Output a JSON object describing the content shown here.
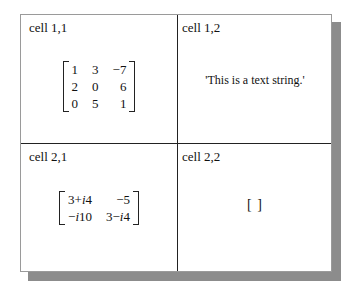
{
  "cells": {
    "c11": {
      "label": "cell 1,1",
      "type": "numeric matrix",
      "matrix": [
        [
          "1",
          "3",
          "−7"
        ],
        [
          "2",
          "0",
          "6"
        ],
        [
          "0",
          "5",
          "1"
        ]
      ]
    },
    "c12": {
      "label": "cell 1,2",
      "type": "text",
      "value": "'This is a text string.'"
    },
    "c21": {
      "label": "cell 2,1",
      "type": "complex matrix",
      "matrix": [
        [
          "3 + i4",
          "−5"
        ],
        [
          "−i10",
          "3 − i4"
        ]
      ],
      "display": [
        [
          "3+",
          "i",
          "4",
          "−5"
        ],
        [
          "−",
          "i",
          "10",
          "3−",
          "i",
          "4"
        ]
      ]
    },
    "c22": {
      "label": "cell 2,2",
      "type": "empty",
      "value": "[ ]"
    }
  },
  "colors": {
    "shadow": "#8c8c8c",
    "divider": "#222222",
    "border": "#9a9a9a"
  }
}
